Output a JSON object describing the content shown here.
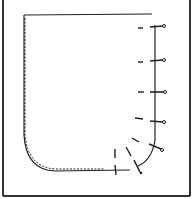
{
  "diagram": {
    "colors": {
      "ink": "#222222",
      "paper": "#ffffff",
      "frame": "#333333"
    },
    "pins": [
      {
        "x1": 150,
        "y1": 27,
        "x2": 164,
        "y2": 26
      },
      {
        "x1": 150,
        "y1": 61,
        "x2": 164,
        "y2": 60
      },
      {
        "x1": 150,
        "y1": 92,
        "x2": 165,
        "y2": 92
      },
      {
        "x1": 150,
        "y1": 121,
        "x2": 164,
        "y2": 122
      },
      {
        "x1": 149,
        "y1": 144,
        "x2": 162,
        "y2": 150
      },
      {
        "x1": 134,
        "y1": 159,
        "x2": 141,
        "y2": 173
      },
      {
        "x1": 115,
        "y1": 165,
        "x2": 116,
        "y2": 175
      }
    ],
    "pin_marks": [
      {
        "x1": 138,
        "y1": 28,
        "x2": 143,
        "y2": 28
      },
      {
        "x1": 138,
        "y1": 62,
        "x2": 143,
        "y2": 62
      },
      {
        "x1": 138,
        "y1": 92,
        "x2": 144,
        "y2": 92
      },
      {
        "x1": 135,
        "y1": 118,
        "x2": 143,
        "y2": 119
      },
      {
        "x1": 132,
        "y1": 138,
        "x2": 139,
        "y2": 142
      },
      {
        "x1": 126,
        "y1": 147,
        "x2": 131,
        "y2": 156
      },
      {
        "x1": 115,
        "y1": 149,
        "x2": 115,
        "y2": 158
      }
    ]
  }
}
